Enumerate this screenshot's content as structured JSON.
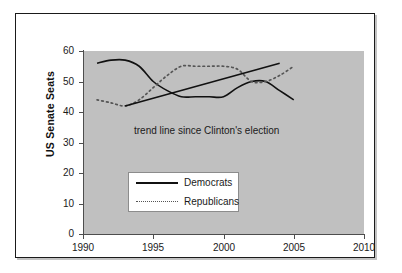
{
  "figure": {
    "background_color": "#ffffff",
    "frame_color": "#1a1a1a",
    "plot_background_color": "#c0c0c0"
  },
  "chart_data": {
    "type": "line",
    "title": "",
    "subtitle": "",
    "xlabel": "",
    "ylabel": "US Senate Seats",
    "xlim": [
      1990,
      2010
    ],
    "ylim": [
      0,
      60
    ],
    "grid": false,
    "legend_position": "center-left",
    "xticks": [
      "1990",
      "1995",
      "2000",
      "2005",
      "2010"
    ],
    "xtick_values": [
      1990,
      1995,
      2000,
      2005,
      2010
    ],
    "yticks": [
      "0",
      "10",
      "20",
      "30",
      "40",
      "50",
      "60"
    ],
    "ytick_values": [
      0,
      10,
      20,
      30,
      40,
      50,
      60
    ],
    "annotations": [
      {
        "text": "trend line since Clinton's election",
        "x": 1997.5,
        "y": 32
      }
    ],
    "series": [
      {
        "name": "Democrats",
        "style": "solid",
        "color": "#111111",
        "x": [
          1991,
          1992,
          1993,
          1994,
          1995,
          1996,
          1997,
          1998,
          1999,
          2000,
          2001,
          2002,
          2003,
          2004,
          2005
        ],
        "values": [
          56,
          57,
          57,
          55,
          50,
          47,
          45,
          45,
          45,
          45,
          48,
          50,
          50,
          47,
          44
        ]
      },
      {
        "name": "Republicans",
        "style": "dotted",
        "color": "#555555",
        "x": [
          1991,
          1992,
          1993,
          1994,
          1995,
          1996,
          1997,
          1998,
          1999,
          2000,
          2001,
          2002,
          2003,
          2004,
          2005
        ],
        "values": [
          44,
          43,
          42,
          44,
          48,
          52,
          55,
          55,
          55,
          55,
          54,
          50,
          50,
          52,
          55
        ]
      },
      {
        "name": "trend line since Clinton's election",
        "style": "solid",
        "color": "#111111",
        "x": [
          1993,
          2004
        ],
        "values": [
          42,
          56
        ]
      }
    ]
  },
  "legend": {
    "entries": [
      {
        "label": "Democrats",
        "style": "solid"
      },
      {
        "label": "Republicans",
        "style": "dotted"
      }
    ]
  }
}
